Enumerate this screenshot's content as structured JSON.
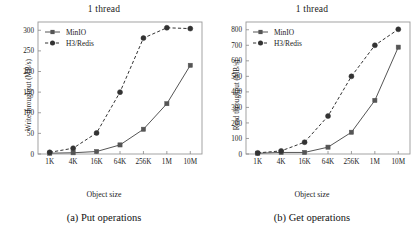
{
  "figure": {
    "background": "#ffffff",
    "panel_count": 2
  },
  "panels": [
    {
      "id": "put",
      "title": "1 thread",
      "caption": "(a) Put operations",
      "xlabel": "Object size",
      "ylabel": "Write throughput (MB/s)"
    },
    {
      "id": "get",
      "title": "1 thread",
      "caption": "(b) Get operations",
      "xlabel": "Object size",
      "ylabel": "Read throughput (MB/s)"
    }
  ],
  "chart_data": [
    {
      "type": "line",
      "id": "put",
      "title": "1 thread",
      "caption": "(a) Put operations",
      "xlabel": "Object size",
      "ylabel": "Write throughput (MB/s)",
      "categories": [
        "1K",
        "4K",
        "16K",
        "64K",
        "256K",
        "1M",
        "10M"
      ],
      "xticks": [
        "1K",
        "4K",
        "16K",
        "64K",
        "256K",
        "1M",
        "10M"
      ],
      "yticks": [
        0,
        50,
        100,
        150,
        200,
        250,
        300
      ],
      "ylim": [
        0,
        320
      ],
      "grid": false,
      "legend_position": "upper-left",
      "series": [
        {
          "name": "MinIO",
          "values": [
            2,
            3,
            6,
            22,
            60,
            122,
            215
          ],
          "marker": "square",
          "linestyle": "solid",
          "color": "#555555"
        },
        {
          "name": "H3/Redis",
          "values": [
            4,
            14,
            51,
            150,
            281,
            306,
            304
          ],
          "marker": "circle",
          "linestyle": "dashed",
          "color": "#333333"
        }
      ]
    },
    {
      "type": "line",
      "id": "get",
      "title": "1 thread",
      "caption": "(b) Get operations",
      "xlabel": "Object size",
      "ylabel": "Read throughput (MB/s)",
      "categories": [
        "1K",
        "4K",
        "16K",
        "64K",
        "256K",
        "1M",
        "10M"
      ],
      "xticks": [
        "1K",
        "4K",
        "16K",
        "64K",
        "256K",
        "1M",
        "10M"
      ],
      "yticks": [
        0,
        100,
        200,
        300,
        400,
        500,
        600,
        700,
        800
      ],
      "ylim": [
        0,
        850
      ],
      "grid": false,
      "legend_position": "upper-left",
      "series": [
        {
          "name": "MinIO",
          "values": [
            5,
            10,
            10,
            44,
            140,
            345,
            688
          ],
          "marker": "square",
          "linestyle": "solid",
          "color": "#555555"
        },
        {
          "name": "H3/Redis",
          "values": [
            7,
            20,
            76,
            244,
            500,
            700,
            803
          ],
          "marker": "circle",
          "linestyle": "dashed",
          "color": "#333333"
        }
      ]
    }
  ],
  "legend": {
    "entries": [
      {
        "label": "MinIO",
        "marker": "square",
        "linestyle": "solid"
      },
      {
        "label": "H3/Redis",
        "marker": "circle",
        "linestyle": "dashed"
      }
    ]
  }
}
